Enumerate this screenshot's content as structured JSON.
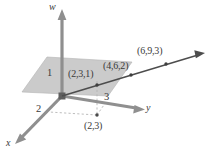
{
  "figure": {
    "type": "3d-coordinate-diagram",
    "background_color": "#ffffff",
    "axes": [
      {
        "name": "w",
        "label": "w",
        "direction": "up",
        "tick_label": "1"
      },
      {
        "name": "y",
        "label": "y",
        "direction": "right",
        "tick_label": "3"
      },
      {
        "name": "x",
        "label": "x",
        "direction": "down-left",
        "tick_label": "2"
      }
    ],
    "axis_labels": {
      "w": "w",
      "y": "y",
      "x": "x"
    },
    "tick_labels": {
      "w_one": "1",
      "x_two": "2",
      "y_three": "3"
    },
    "points": [
      {
        "name": "point-2-3-1",
        "label": "(2,3,1)"
      },
      {
        "name": "point-4-6-2",
        "label": "(4,6,2)"
      },
      {
        "name": "point-6-9-3",
        "label": "(6,9,3)"
      },
      {
        "name": "projection-2-3",
        "label": "(2,3)"
      }
    ],
    "point_labels": {
      "p1": "(2,3,1)",
      "p2": "(4,6,2)",
      "p3": "(6,9,3)",
      "proj": "(2,3)"
    },
    "colors": {
      "axis": "#8c8c8c",
      "axis_dark": "#7a7a7a",
      "plane_fill": "#c8c8c8",
      "plane_edge": "#a8a8a8",
      "line": "#4a4a4a",
      "dashed": "#b0b0b0",
      "text": "#3a3a3a",
      "origin": "#5a5a5a"
    },
    "plane": {
      "name": "horizontal-plane-w-equals-1",
      "fill": "#c8c8c8"
    },
    "line": {
      "name": "direction-line",
      "description": "line through origin and the plotted points"
    }
  }
}
